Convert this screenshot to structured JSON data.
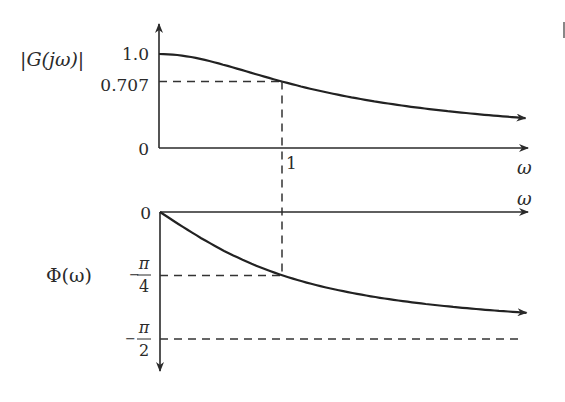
{
  "chart_data": [
    {
      "type": "line",
      "title": "",
      "ylabel": "|G(jω)|",
      "xlabel": "ω",
      "yticks": [
        {
          "value": 0,
          "label": "0"
        },
        {
          "value": 0.707,
          "label": "0.707"
        },
        {
          "value": 1.0,
          "label": "1.0"
        }
      ],
      "xticks": [
        {
          "value": 1,
          "label": "1"
        }
      ],
      "xlim": [
        0,
        4.5
      ],
      "ylim": [
        0,
        1.25
      ],
      "series": [
        {
          "name": "magnitude",
          "function": "1/sqrt(1+ω^2)",
          "x": [
            0,
            0.25,
            0.5,
            0.75,
            1,
            1.5,
            2,
            2.5,
            3,
            3.5,
            4,
            4.5
          ],
          "values": [
            1.0,
            0.97,
            0.894,
            0.8,
            0.707,
            0.555,
            0.447,
            0.371,
            0.316,
            0.275,
            0.243,
            0.217
          ]
        }
      ],
      "annotations": [
        {
          "type": "dashed-guide",
          "from": "y-axis",
          "at": 0.707,
          "to_x": 1
        },
        {
          "type": "dashed-guide",
          "vertical_at_x": 1
        }
      ],
      "grid": false
    },
    {
      "type": "line",
      "title": "",
      "ylabel": "Φ(ω)",
      "xlabel": "ω",
      "yticks": [
        {
          "value": 0,
          "label": "0"
        },
        {
          "value": -0.7854,
          "label_num": "π",
          "label_den": "4",
          "label_sign": "−"
        },
        {
          "value": -1.5708,
          "label_num": "π",
          "label_den": "2",
          "label_sign": "−"
        }
      ],
      "xlim": [
        0,
        4.5
      ],
      "ylim": [
        -1.95,
        0
      ],
      "series": [
        {
          "name": "phase",
          "function": "-arctan(ω)",
          "x": [
            0,
            0.25,
            0.5,
            0.75,
            1,
            1.5,
            2,
            2.5,
            3,
            3.5,
            4,
            4.5
          ],
          "values": [
            0,
            -0.245,
            -0.464,
            -0.644,
            -0.785,
            -0.983,
            -1.107,
            -1.19,
            -1.249,
            -1.292,
            -1.326,
            -1.352
          ]
        }
      ],
      "annotations": [
        {
          "type": "dashed-guide",
          "from": "y-axis",
          "at": -0.7854,
          "to_x": 1
        },
        {
          "type": "dashed-asymptote",
          "at": -1.5708
        }
      ],
      "grid": false
    }
  ],
  "labels": {
    "top_ylabel": "|G(jω)|",
    "top_xlabel": "ω",
    "bottom_ylabel": "Φ(ω)",
    "bottom_xlabel": "ω",
    "tick_1": "1",
    "tick_0_top": "0",
    "tick_0707": "0.707",
    "tick_10": "1.0",
    "tick_0_bottom": "0",
    "pi": "π",
    "den4": "4",
    "den2": "2",
    "minus": "−"
  }
}
